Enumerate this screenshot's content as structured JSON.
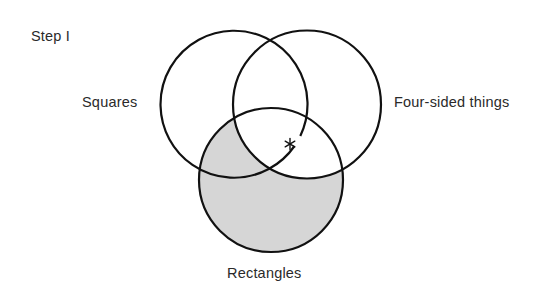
{
  "diagram": {
    "step_label": "Step I",
    "sets": [
      {
        "name": "squares",
        "label": "Squares",
        "cx": 234,
        "cy": 104.5,
        "r": 73.5
      },
      {
        "name": "four-sided-things",
        "label": "Four-sided things",
        "cx": 307,
        "cy": 104.5,
        "r": 74
      },
      {
        "name": "rectangles",
        "label": "Rectangles",
        "cx": 271,
        "cy": 180,
        "r": 72
      }
    ],
    "shaded_region": "Rectangles outside Four-sided things",
    "marker": {
      "symbol": "*",
      "x": 290,
      "y": 144,
      "region": "Squares ∩ Four-sided things ∩ Rectangles boundary"
    },
    "colors": {
      "stroke": "#111111",
      "shade": "#d6d6d6",
      "text": "#2a2a2a",
      "background": "#ffffff"
    }
  }
}
